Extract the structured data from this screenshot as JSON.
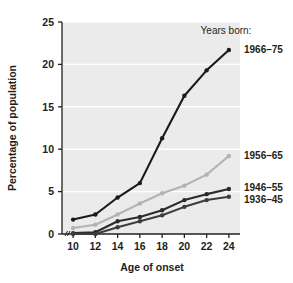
{
  "chart_data": {
    "type": "line",
    "title": "",
    "xlabel": "Age of onset",
    "ylabel": "Percentage of population",
    "legend_title": "Years born:",
    "legend_position": "right-inline",
    "grid": true,
    "grid_color": "#ffffff",
    "plot_background": "#ebebeb",
    "x": [
      10,
      12,
      14,
      16,
      18,
      20,
      22,
      24
    ],
    "xlim": [
      9,
      25
    ],
    "ylim": [
      0,
      25
    ],
    "xticks": [
      "10",
      "12",
      "14",
      "16",
      "18",
      "20",
      "22",
      "24"
    ],
    "yticks": [
      "0",
      "5",
      "10",
      "15",
      "20",
      "25"
    ],
    "ytick_values": [
      0,
      5,
      10,
      15,
      20,
      25
    ],
    "axis_break": true,
    "series": [
      {
        "name": "1966–75",
        "color": "#1a1a1a",
        "values": [
          1.7,
          2.3,
          4.3,
          6.0,
          11.3,
          16.3,
          19.3,
          21.7
        ]
      },
      {
        "name": "1956–65",
        "color": "#b3b3b3",
        "values": [
          0.7,
          1.1,
          2.3,
          3.6,
          4.8,
          5.7,
          7.0,
          9.2
        ]
      },
      {
        "name": "1946–55",
        "color": "#2b2b2b",
        "values": [
          0.1,
          0.2,
          1.5,
          2.0,
          2.8,
          4.0,
          4.7,
          5.3
        ]
      },
      {
        "name": "1936–45",
        "color": "#3d3d3d",
        "values": [
          0.0,
          0.0,
          0.8,
          1.5,
          2.2,
          3.2,
          4.0,
          4.4
        ]
      }
    ]
  }
}
